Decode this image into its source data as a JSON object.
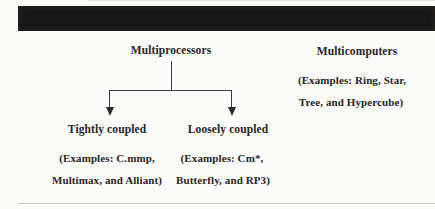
{
  "colors": {
    "background": "#fcfcfa",
    "text": "#2b241e",
    "header_bar": "#181818",
    "connector_line": "#3b3b3b",
    "bottom_rule": "#c6c6c3"
  },
  "diagram": {
    "root": {
      "label": "Multiprocessors"
    },
    "branches": [
      {
        "label": "Tightly coupled",
        "examples": [
          "(Examples: C.mmp,",
          "Multimax, and Alliant)"
        ]
      },
      {
        "label": "Loosely coupled",
        "examples": [
          "(Examples: Cm*,",
          "Butterfly, and RP3)"
        ]
      }
    ],
    "sibling": {
      "label": "Multicomputers",
      "examples": [
        "(Examples: Ring, Star,",
        "Tree, and Hypercube)"
      ]
    }
  }
}
